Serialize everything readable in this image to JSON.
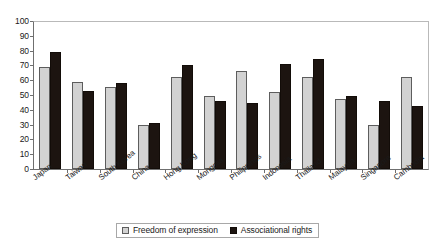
{
  "chart_data": {
    "type": "bar",
    "title": "",
    "subtitle": "",
    "xlabel": "",
    "ylabel": "",
    "ylim": [
      0,
      100
    ],
    "y_ticks": [
      0,
      10,
      20,
      30,
      40,
      50,
      60,
      70,
      80,
      90,
      100
    ],
    "grid": false,
    "legend_position": "bottom",
    "categories": [
      "Japan",
      "Taiwan",
      "South Korea",
      "China",
      "Hong Kong",
      "Mongolia",
      "Philippines",
      "Indonesia",
      "Thailand",
      "Malaysia",
      "Singapore",
      "Cambodia"
    ],
    "series": [
      {
        "name": "Freedom of expression",
        "color": "#d2d2d2",
        "values": [
          69,
          58.5,
          55.5,
          29.5,
          62,
          49.5,
          66,
          52,
          62,
          47,
          30,
          62
        ]
      },
      {
        "name": "Associational rights",
        "color": "#1c1410",
        "values": [
          79,
          52.5,
          58,
          31,
          70.5,
          46,
          44.5,
          71,
          74.5,
          49.5,
          46,
          42.5
        ]
      }
    ]
  },
  "legend": {
    "items": [
      {
        "label": "Freedom of expression",
        "swatch": "light-square-swatch"
      },
      {
        "label": "Associational rights",
        "swatch": "dark-square-swatch"
      }
    ]
  }
}
